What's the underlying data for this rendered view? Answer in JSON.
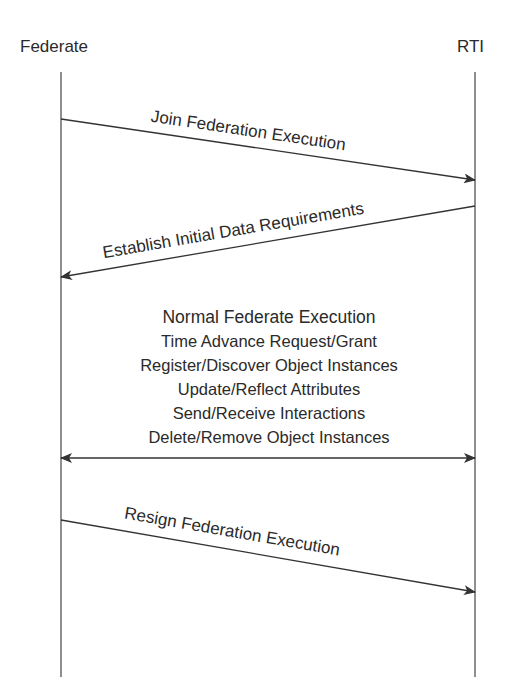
{
  "participants": {
    "left": "Federate",
    "right": "RTI"
  },
  "messages": [
    {
      "label": "Join Federation Execution",
      "direction": "left-to-right"
    },
    {
      "label": "Establish Initial Data Requirements",
      "direction": "right-to-left"
    },
    {
      "label": "Resign Federation Execution",
      "direction": "left-to-right"
    }
  ],
  "execution_block": {
    "title": "Normal Federate Execution",
    "lines": [
      "Time Advance Request/Grant",
      "Register/Discover Object Instances",
      "Update/Reflect Attributes",
      "Send/Receive Interactions",
      "Delete/Remove Object Instances"
    ],
    "direction": "bidirectional"
  },
  "colors": {
    "line": "#333333",
    "text": "#2a2a2a",
    "background": "#ffffff"
  }
}
